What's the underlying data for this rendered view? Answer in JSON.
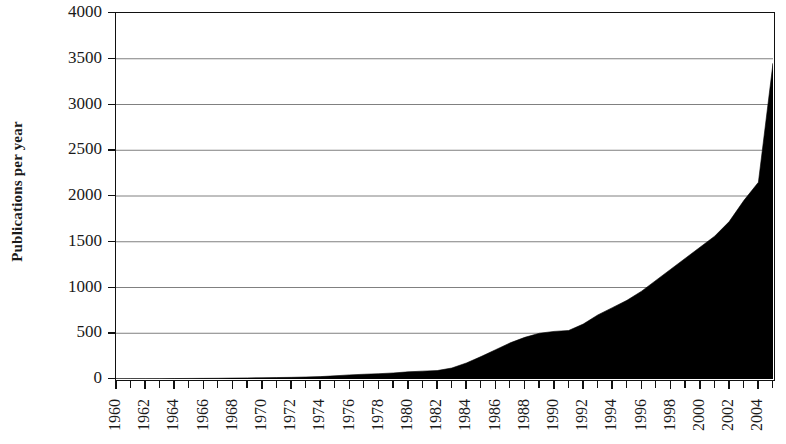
{
  "chart_data": {
    "type": "area",
    "title": "",
    "subtitle": "",
    "xlabel": "",
    "ylabel": "Publications per year",
    "xlim": [
      1960,
      2005
    ],
    "ylim": [
      0,
      4000
    ],
    "grid": true,
    "legend": false,
    "legend_position": "none",
    "series_color": "#000000",
    "axis_color": "#111111",
    "gridline_color": "#808080",
    "background": "#ffffff",
    "y_ticks": [
      0,
      500,
      1000,
      1500,
      2000,
      2500,
      3000,
      3500,
      4000
    ],
    "y_tick_labels": [
      "0",
      "500",
      "1000",
      "1500",
      "2000",
      "2500",
      "3000",
      "3500",
      "4000"
    ],
    "x_tick_labels": [
      "1960",
      "1962",
      "1964",
      "1966",
      "1968",
      "1970",
      "1972",
      "1974",
      "1976",
      "1978",
      "1980",
      "1982",
      "1984",
      "1986",
      "1988",
      "1990",
      "1992",
      "1994",
      "1996",
      "1998",
      "2000",
      "2002",
      "2004"
    ],
    "x_tick_label_rotation": -90,
    "x": [
      1960,
      1961,
      1962,
      1963,
      1964,
      1965,
      1966,
      1967,
      1968,
      1969,
      1970,
      1971,
      1972,
      1973,
      1974,
      1975,
      1976,
      1977,
      1978,
      1979,
      1980,
      1981,
      1982,
      1983,
      1984,
      1985,
      1986,
      1987,
      1988,
      1989,
      1990,
      1991,
      1992,
      1993,
      1994,
      1995,
      1996,
      1997,
      1998,
      1999,
      2000,
      2001,
      2002,
      2003,
      2004,
      2005
    ],
    "values": [
      2,
      3,
      3,
      4,
      5,
      6,
      7,
      8,
      10,
      12,
      14,
      16,
      18,
      22,
      26,
      35,
      45,
      52,
      58,
      66,
      78,
      86,
      92,
      120,
      175,
      245,
      320,
      395,
      455,
      500,
      520,
      530,
      600,
      700,
      780,
      860,
      960,
      1080,
      1200,
      1320,
      1440,
      1560,
      1720,
      1950,
      2150,
      3450
    ],
    "series": [
      {
        "name": "Publications per year",
        "color": "#000000",
        "values": [
          2,
          3,
          3,
          4,
          5,
          6,
          7,
          8,
          10,
          12,
          14,
          16,
          18,
          22,
          26,
          35,
          45,
          52,
          58,
          66,
          78,
          86,
          92,
          120,
          175,
          245,
          320,
          395,
          455,
          500,
          520,
          530,
          600,
          700,
          780,
          860,
          960,
          1080,
          1200,
          1320,
          1440,
          1560,
          1720,
          1950,
          2150,
          3450
        ]
      }
    ],
    "annotations": []
  }
}
